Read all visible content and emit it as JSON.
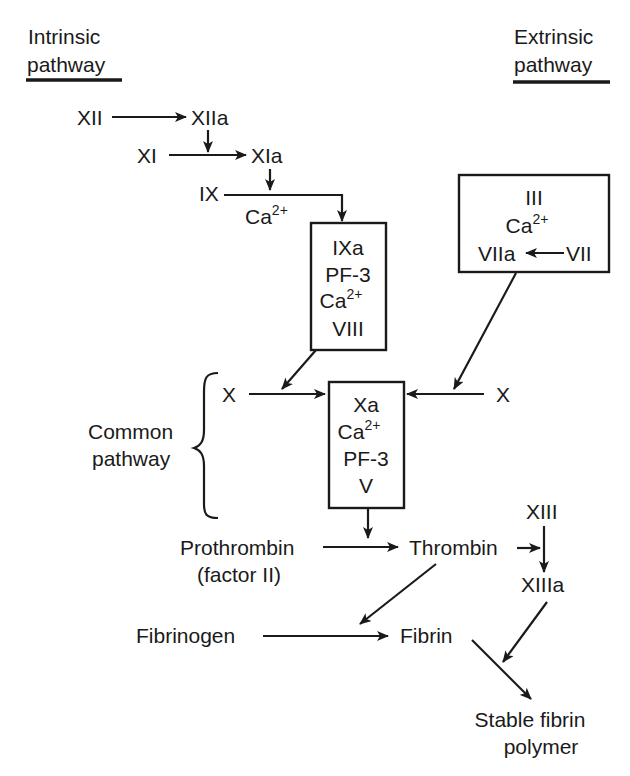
{
  "headings": {
    "intrinsic": {
      "line1": "Intrinsic",
      "line2": "pathway"
    },
    "extrinsic": {
      "line1": "Extrinsic",
      "line2": "pathway"
    },
    "common": {
      "line1": "Common",
      "line2": "pathway"
    }
  },
  "intrinsic": {
    "xii": "XII",
    "xiia": "XIIa",
    "xi": "XI",
    "xia": "XIa",
    "ix": "IX",
    "ix_cofactor": {
      "base": "Ca",
      "sup": "2+"
    },
    "tenase_box": {
      "line1": "IXa",
      "line2": "PF-3",
      "line3": {
        "base": "Ca",
        "sup": "2+"
      },
      "line4": "VIII"
    }
  },
  "extrinsic": {
    "box": {
      "line1": "III",
      "line2": {
        "base": "Ca",
        "sup": "2+"
      },
      "viia": "VIIa",
      "vii": "VII"
    }
  },
  "common": {
    "x_left": "X",
    "x_right": "X",
    "prothrombinase_box": {
      "line1": "Xa",
      "line2": {
        "base": "Ca",
        "sup": "2+"
      },
      "line3": "PF-3",
      "line4": "V"
    },
    "prothrombin": {
      "line1": "Prothrombin",
      "line2": "(factor II)"
    },
    "thrombin": "Thrombin",
    "xiii": "XIII",
    "xiiia": "XIIIa",
    "fibrinogen": "Fibrinogen",
    "fibrin": "Fibrin",
    "stable_polymer": {
      "line1": "Stable fibrin",
      "line2": "polymer"
    }
  },
  "colors": {
    "ink": "#1a1a1a",
    "background": "#ffffff"
  }
}
